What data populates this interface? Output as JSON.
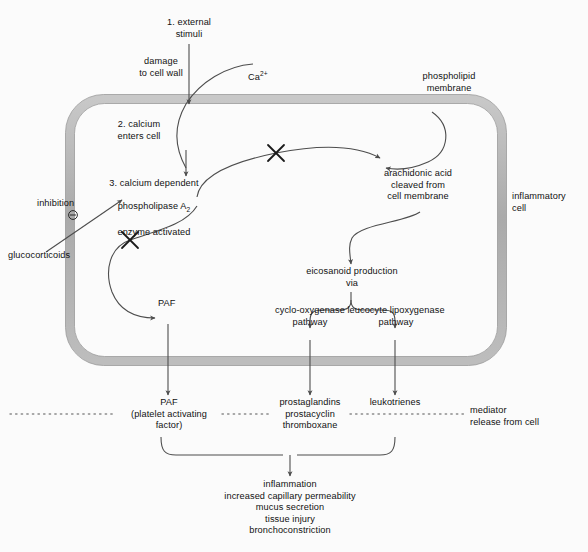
{
  "diagram": {
    "colors": {
      "background": "#fbfbfb",
      "membrane_fill": "#b3b3b3",
      "membrane_edge": "#8c8c8c",
      "line": "#4d4d4d",
      "text": "#111111",
      "dotted": "#8c8c8c"
    },
    "steps": {
      "step1": "1. external\nstimuli",
      "step2": "2. calcium\nenters cell",
      "step3_line1": "3. calcium dependent",
      "step3_line2_a": "phospholipase A",
      "step3_line2_sub": "2",
      "step3_line3": "enzyme activated"
    },
    "labels": {
      "damage_to_cell_wall": "damage\nto cell wall",
      "calcium_ion_base": "Ca",
      "calcium_ion_sup": "2+",
      "phospholipid_membrane": "phospholipid\nmembrane",
      "arachidonic_acid": "arachidonic acid\ncleaved from\ncell membrane",
      "inflammatory_cell": "inflammatory\ncell",
      "inhibition": "inhibition",
      "inhibition_symbol": "⊖",
      "glucocorticoids": "glucocorticoids",
      "eicosanoid_production": "eicosanoid production\nvia",
      "cyclo_oxygenase_pathway": "cyclo-oxygenase\npathway",
      "leucocyte_lipoxygenase_pathway": "leucocyte lipoxygenase\npathway",
      "paf_inside": "PAF",
      "paf_outside": "PAF\n(platelet activating\nfactor)",
      "prostaglandins": "prostaglandins\nprostacyclin\nthromboxane",
      "leukotrienes": "leukotrienes",
      "mediator_release": "mediator\nrelease from cell",
      "outcomes": "inflammation\nincreased capillary permeability\nmucus secretion\ntissue injury\nbronchoconstriction"
    },
    "icons": {
      "block_mark_1": "x-block-icon",
      "block_mark_2": "x-block-icon",
      "inhibition_marker": "minus-circle-icon"
    }
  }
}
